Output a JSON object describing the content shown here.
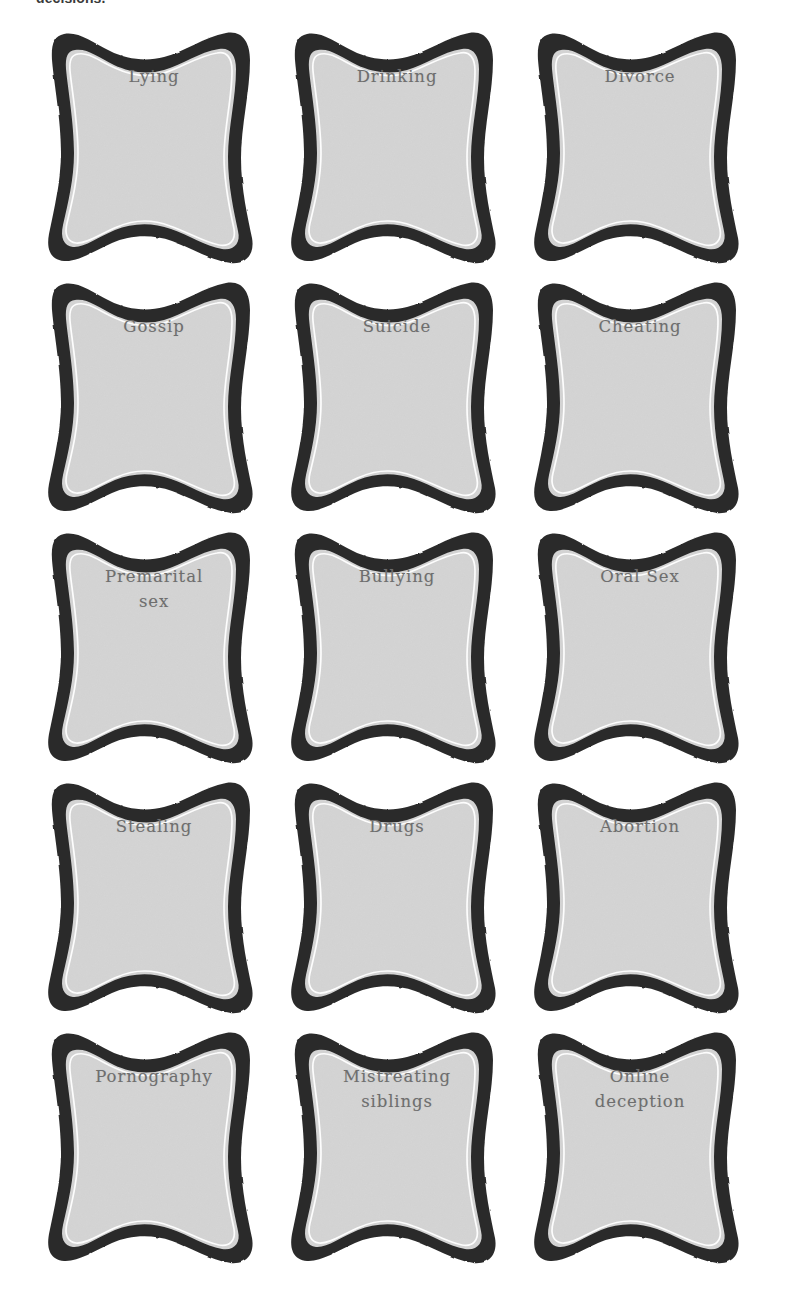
{
  "page": {
    "clipped_heading": "decisions.",
    "background_color": "#ffffff"
  },
  "style_tokens": {
    "card_border_color": "#2b2b2b",
    "card_inner_outline_color": "#ffffff",
    "card_fill_color": "#d4d4d4",
    "label_text_color": "#6e6e6e"
  },
  "cards": [
    {
      "label": "Lying"
    },
    {
      "label": "Drinking"
    },
    {
      "label": "Divorce"
    },
    {
      "label": "Gossip"
    },
    {
      "label": "Suicide"
    },
    {
      "label": "Cheating"
    },
    {
      "label": "Premarital\nsex"
    },
    {
      "label": "Bullying"
    },
    {
      "label": "Oral Sex"
    },
    {
      "label": "Stealing"
    },
    {
      "label": "Drugs"
    },
    {
      "label": "Abortion"
    },
    {
      "label": "Pornography"
    },
    {
      "label": "Mistreating\nsiblings"
    },
    {
      "label": "Online\ndeception"
    }
  ]
}
